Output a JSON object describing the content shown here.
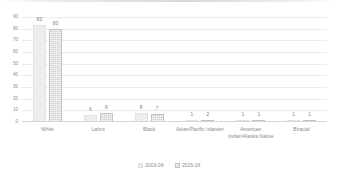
{
  "chart_data": {
    "type": "bar",
    "title": "",
    "subtitle": "",
    "xlabel": "",
    "ylabel": "",
    "ylim": [
      0,
      90
    ],
    "y_ticks": [
      0,
      10,
      20,
      30,
      40,
      50,
      60,
      70,
      80,
      90
    ],
    "grid": true,
    "legend_position": "bottom",
    "categories": [
      "White",
      "Latinx",
      "Black",
      "Asian/Pacific Islander",
      "American Indian/Alaska Native",
      "Biracial"
    ],
    "series": [
      {
        "name": "2003-04",
        "values": [
          83,
          6,
          8,
          1,
          1,
          1
        ],
        "color": "#ededed"
      },
      {
        "name": "2015-16",
        "values": [
          80,
          8,
          7,
          2,
          1,
          1
        ],
        "color": "#cfcfcf"
      }
    ],
    "data_labels": [
      [
        "83",
        "80"
      ],
      [
        "6",
        "8"
      ],
      [
        "8",
        "7"
      ],
      [
        "1",
        "2"
      ],
      [
        "1",
        "1"
      ],
      [
        "1",
        "1"
      ]
    ]
  },
  "axis": {
    "y_tick_labels": [
      "90",
      "80",
      "70",
      "60",
      "50",
      "40",
      "30",
      "20",
      "10",
      "0"
    ]
  },
  "legend": {
    "items": [
      {
        "label": "2003-04"
      },
      {
        "label": "2015-16"
      }
    ]
  }
}
